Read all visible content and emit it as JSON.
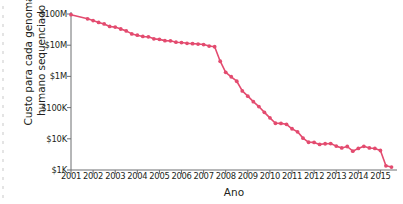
{
  "chart_data": {
    "type": "line",
    "title": "",
    "xlabel": "Ano",
    "ylabel_lines": [
      "Custo para cada genoma",
      "humano sequenciado"
    ],
    "ylabel": "Custo para cada genoma humano sequenciado",
    "xlim": [
      2001,
      2015.75
    ],
    "ylim": [
      1000,
      100000000
    ],
    "yscale": "log",
    "grid": false,
    "legend": null,
    "series_color": "#e34b6f",
    "marker": "circle",
    "xticks": [
      2001,
      2002,
      2003,
      2004,
      2005,
      2006,
      2007,
      2008,
      2009,
      2010,
      2011,
      2012,
      2013,
      2014,
      2015
    ],
    "xtick_labels": [
      "2001",
      "2002",
      "2003",
      "2004",
      "2005",
      "2006",
      "2007",
      "2008",
      "2009",
      "2010",
      "2011",
      "2012",
      "2013",
      "2014",
      "2015"
    ],
    "yticks": [
      1000,
      10000,
      100000,
      1000000,
      10000000,
      100000000
    ],
    "ytick_labels": [
      "$1K",
      "$10K",
      "$100K",
      "$1M",
      "$10M",
      "$100M"
    ],
    "series": [
      {
        "name": "Custo por genoma",
        "x": [
          2001.0,
          2001.75,
          2002.0,
          2002.25,
          2002.5,
          2002.75,
          2003.0,
          2003.25,
          2003.5,
          2003.75,
          2004.0,
          2004.25,
          2004.5,
          2004.75,
          2005.0,
          2005.25,
          2005.5,
          2005.75,
          2006.0,
          2006.25,
          2006.5,
          2006.75,
          2007.0,
          2007.25,
          2007.5,
          2007.75,
          2008.0,
          2008.25,
          2008.5,
          2008.75,
          2009.0,
          2009.25,
          2009.5,
          2009.75,
          2010.0,
          2010.25,
          2010.5,
          2010.75,
          2011.0,
          2011.25,
          2011.5,
          2011.75,
          2012.0,
          2012.25,
          2012.5,
          2012.75,
          2013.0,
          2013.25,
          2013.5,
          2013.75,
          2014.0,
          2014.25,
          2014.5,
          2014.75,
          2015.0,
          2015.25,
          2015.5
        ],
        "y": [
          95263072,
          70175437,
          61448422,
          53751684,
          48000000,
          40000000,
          38000000,
          33000000,
          28780376,
          23000000,
          20935599,
          19100000,
          18519312,
          16000000,
          15400000,
          14000000,
          13801124,
          12500000,
          12150000,
          11500000,
          11200000,
          10900000,
          10474556,
          9408739,
          8925205,
          3063820,
          1352982,
          974016,
          700000,
          342502,
          232735,
          154714,
          108065,
          70333,
          47079,
          31512,
          31125,
          29092,
          20963,
          16712,
          10497,
          7743,
          7666,
          6618,
          6940,
          7050,
          5826,
          5096,
          5671,
          4008,
          4920,
          5731,
          5096,
          4905,
          4211,
          1363,
          1245
        ]
      }
    ],
    "annotations": []
  },
  "axes": {
    "x_axis_name": "year-axis",
    "y_axis_name": "cost-axis"
  }
}
